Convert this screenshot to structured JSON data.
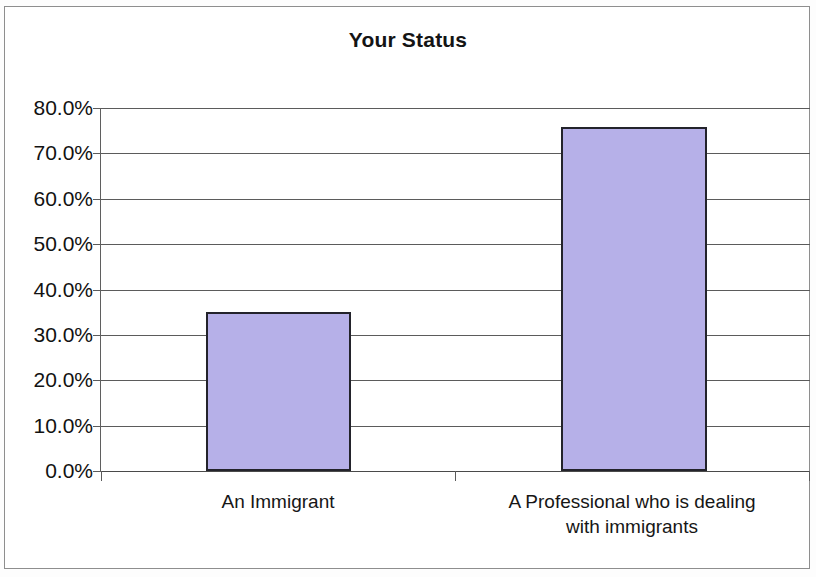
{
  "chart_data": {
    "type": "bar",
    "title": "Your Status",
    "xlabel": "",
    "ylabel": "",
    "categories": [
      "An Immigrant",
      "A Professional who is dealing with immigrants"
    ],
    "category_lines": [
      [
        "An Immigrant"
      ],
      [
        "A Professional who is dealing",
        "with immigrants"
      ]
    ],
    "values": [
      35.0,
      75.8
    ],
    "value_labels": [
      "35.0%",
      "75.8%"
    ],
    "ylim": [
      0,
      80
    ],
    "ytick_values": [
      80,
      70,
      60,
      50,
      40,
      30,
      20,
      10,
      0
    ],
    "ytick_labels": [
      "80.0%",
      "70.0%",
      "60.0%",
      "50.0%",
      "40.0%",
      "30.0%",
      "20.0%",
      "10.0%",
      "0.0%"
    ],
    "grid": true,
    "legend": false,
    "legend_position": "none",
    "bar_color": "#B6B0E8",
    "bar_border_color": "#23232B",
    "gridline_color": "#5B5B5B",
    "text_color": "#121212",
    "background_color": "#FFFFFF"
  }
}
